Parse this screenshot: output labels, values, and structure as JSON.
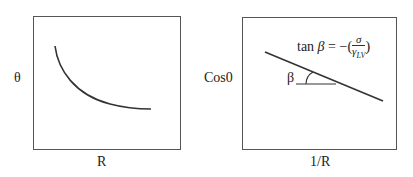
{
  "left_panel": {
    "ylabel": "θ",
    "xlabel": "R",
    "curve_description": "decreasing convex curve"
  },
  "right_panel": {
    "ylabel": "Cos0",
    "xlabel": "1/R",
    "angle_label": "β",
    "formula": {
      "lhs_fn": "tan ",
      "lhs_var": "β",
      "equals": " = −(",
      "numerator": "σ",
      "denominator": "γ",
      "denominator_sub": "LV",
      "close": ")"
    }
  },
  "colors": {
    "line": "#333333",
    "frame": "#555555",
    "text": "#222222"
  }
}
